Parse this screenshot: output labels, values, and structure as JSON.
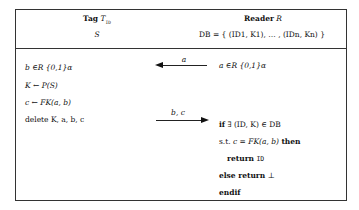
{
  "tag": {
    "title_word": "Tag",
    "title_symbol": "T",
    "title_sub": "ID",
    "state": "S",
    "steps": [
      "b ∈R {0,1}α",
      "K ← P(S)",
      "c ← FK(a, b)",
      "delete K, a, b, c"
    ]
  },
  "reader": {
    "title_word": "Reader",
    "title_symbol": "R",
    "db": "DB = { (ID1, K1), … , (IDn, Kn) }",
    "steps": [
      "a ∈R {0,1}α"
    ],
    "check": {
      "if_kw": "if",
      "if_cond": "∃ (ID, K) ∈ DB",
      "st_prefix": "s.t.",
      "st_cond": "c = FK(a, b)",
      "then_kw": "then",
      "return_kw": "return",
      "return_val": "ID",
      "else_kw": "else return",
      "else_val": "⊥",
      "endif_kw": "endif"
    }
  },
  "messages": [
    {
      "label": "a",
      "direction": "reader-to-tag"
    },
    {
      "label": "b, c",
      "direction": "tag-to-reader"
    }
  ]
}
